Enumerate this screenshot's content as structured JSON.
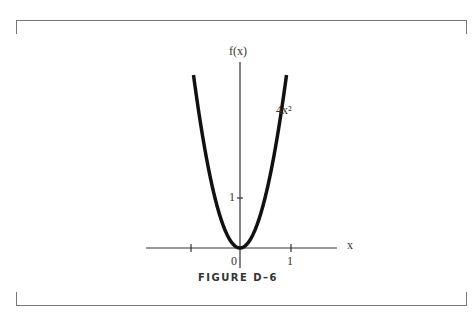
{
  "figure": {
    "caption": "FIGURE D–6"
  },
  "chart_data": {
    "type": "line",
    "title": "",
    "xlabel": "x",
    "ylabel": "f(x)",
    "series": [
      {
        "name": "4x²",
        "function": "f(x) = 4x^2",
        "x": [
          -0.93,
          -0.8,
          -0.6,
          -0.4,
          -0.2,
          0,
          0.2,
          0.4,
          0.6,
          0.8,
          0.93
        ],
        "values": [
          3.46,
          2.56,
          1.44,
          0.64,
          0.16,
          0,
          0.16,
          0.64,
          1.44,
          2.56,
          3.46
        ]
      }
    ],
    "x_ticks": [
      -1,
      0,
      1
    ],
    "x_tick_labels": [
      "",
      "0",
      "1"
    ],
    "y_ticks": [
      1
    ],
    "y_tick_labels": [
      "1"
    ],
    "xlim": [
      -1.9,
      1.95
    ],
    "ylim": [
      0,
      3.7
    ],
    "grid": false,
    "annotation": "4x²"
  },
  "labels": {
    "y_axis": "f(x)",
    "x_axis": "x",
    "origin": "0",
    "x_one": "1",
    "y_one": "1",
    "curve": "4x²"
  }
}
